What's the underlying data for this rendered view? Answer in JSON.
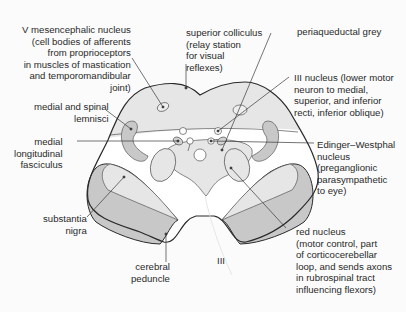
{
  "figure": {
    "colors": {
      "background": "#fbfbfb",
      "outline": "#2b2b2b",
      "light_fill": "#e6e6e6",
      "mid_fill": "#d2d2d2",
      "dark_fill": "#bdbdbd",
      "leader": "#3a3a3a",
      "text": "#2a2a2a"
    },
    "labels": {
      "v_mesencephalic": "V mesencephalic nucleus\n(cell bodies of afferents\nfrom proprioceptors\nin muscles of mastication\nand temporomandibular\njoint)",
      "superior_colliculus": "superior colliculus\n(relay station\nfor visual\nreflexes)",
      "periaqueductal_grey": "periaqueductal grey",
      "iii_nucleus": "III nucleus (lower motor\nneuron to medial,\nsuperior, and inferior\nrecti, inferior oblique)",
      "medial_spinal_lemnisci": "medial and spinal\nlemnisci",
      "mlf": "medial\nlongitudinal\nfasciculus",
      "edinger_westphal": "Edinger–Westphal\nnucleus\n(preganglionic\nparasympathetic\nto eye)",
      "substantia_nigra": "substantia\nnigra",
      "red_nucleus": "red nucleus\n(motor control, part\nof corticocerebellar\nloop, and sends axons\nin rubrospinal tract\ninfluencing flexors)",
      "cerebral_peduncle": "cerebral\npeduncle",
      "cn_iii": "III"
    }
  }
}
